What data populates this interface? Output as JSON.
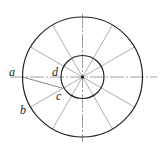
{
  "diagram": {
    "type": "concentric-circles-with-radial-divisions",
    "center": [
      82.5,
      77
    ],
    "outer_radius": 60,
    "inner_radius": 21.5,
    "divisions": 12,
    "labels": [
      {
        "id": "a",
        "text": "a",
        "x": 9,
        "y": 78
      },
      {
        "id": "b",
        "text": "b",
        "x": 20,
        "y": 114
      },
      {
        "id": "c",
        "text": "c",
        "x": 57,
        "y": 101
      },
      {
        "id": "d",
        "text": "d",
        "x": 52,
        "y": 77
      }
    ],
    "colors": {
      "outer": "#222222",
      "inner": "#222222",
      "radial": "#999999",
      "axis": "#888888"
    }
  }
}
